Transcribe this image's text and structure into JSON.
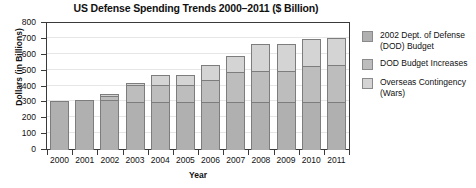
{
  "chart_data": {
    "type": "bar",
    "stacked": true,
    "title": "US Defense Spending Trends 2000–2011 ($ Billion)",
    "xlabel": "Year",
    "ylabel": "Dollars (in Billions)",
    "categories": [
      "2000",
      "2001",
      "2002",
      "2003",
      "2004",
      "2005",
      "2006",
      "2007",
      "2008",
      "2009",
      "2010",
      "2011"
    ],
    "ylim": [
      0,
      800
    ],
    "yticks": [
      0,
      100,
      200,
      300,
      400,
      500,
      600,
      700,
      800
    ],
    "ytick_labels": [
      "0",
      "100",
      "200",
      "300",
      "400",
      "500",
      "600",
      "700",
      "800"
    ],
    "grid": true,
    "legend_position": "right",
    "series": [
      {
        "name": "2002 Dept. of Defense (DOD) Budget",
        "color": "#b0b0b0",
        "values": [
          306,
          312,
          316,
          300,
          300,
          300,
          300,
          300,
          300,
          300,
          300,
          300
        ]
      },
      {
        "name": "DOD Budget Increases",
        "color": "#bdbdbd",
        "values": [
          0,
          0,
          22,
          112,
          112,
          112,
          140,
          190,
          200,
          200,
          230,
          235
        ]
      },
      {
        "name": "Overseas Contingency (Wars)",
        "color": "#d4d4d4",
        "values": [
          0,
          0,
          12,
          13,
          58,
          58,
          95,
          105,
          168,
          165,
          170,
          170
        ]
      }
    ],
    "totals": [
      306,
      312,
      350,
      425,
      470,
      470,
      535,
      595,
      668,
      665,
      700,
      705
    ]
  },
  "legend": {
    "items": [
      {
        "label_line1": "2002 Dept. of Defense",
        "label_line2": "(DOD) Budget",
        "swatch": "#b0b0b0"
      },
      {
        "label_line1": "DOD Budget Increases",
        "label_line2": "",
        "swatch": "#bdbdbd"
      },
      {
        "label_line1": "Overseas Contingency",
        "label_line2": "(Wars)",
        "swatch": "#d4d4d4"
      }
    ]
  }
}
